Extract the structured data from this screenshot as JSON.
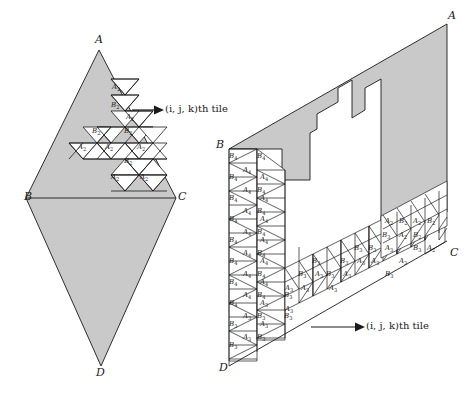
{
  "figure": {
    "colors": {
      "shaded_fill": "#c9c9c9",
      "tile_fill": "#ffffff",
      "stroke": "#1a1a1a",
      "background": "#ffffff"
    }
  },
  "left_diagram": {
    "name": "rhombus-tiling",
    "corners": [
      {
        "id": "A",
        "label": "A",
        "x": 99,
        "y": 42
      },
      {
        "id": "B",
        "label": "B",
        "x": 31,
        "y": 198
      },
      {
        "id": "C",
        "label": "C",
        "x": 174,
        "y": 198
      },
      {
        "id": "D",
        "label": "D",
        "x": 101,
        "y": 372
      }
    ],
    "annotation": {
      "text_prefix": "(",
      "text": "(i, j, k)th tile",
      "arrow_from_x": 132,
      "arrow_to_x": 156,
      "y": 110
    },
    "tiles": [
      {
        "label": "A",
        "sub": "2",
        "x": 117,
        "y": 87
      },
      {
        "label": "B",
        "sub": "2",
        "x": 116,
        "y": 105
      },
      {
        "label": "A",
        "sub": "2",
        "x": 131,
        "y": 117
      },
      {
        "label": "B",
        "sub": "2",
        "x": 97,
        "y": 131
      },
      {
        "label": "B",
        "sub": "2",
        "x": 129,
        "y": 131
      },
      {
        "label": "A",
        "sub": "2",
        "x": 83,
        "y": 147
      },
      {
        "label": "A",
        "sub": "2",
        "x": 110,
        "y": 147
      },
      {
        "label": "A",
        "sub": "2",
        "x": 142,
        "y": 147
      },
      {
        "label": "B",
        "sub": "2",
        "x": 129,
        "y": 161
      },
      {
        "label": "A",
        "sub": "2",
        "x": 116,
        "y": 177
      },
      {
        "label": "A",
        "sub": "2",
        "x": 145,
        "y": 177
      }
    ]
  },
  "right_diagram": {
    "name": "deformed-polygon-tiling",
    "corners": [
      {
        "id": "A",
        "label": "A",
        "x": 450,
        "y": 16
      },
      {
        "id": "B",
        "label": "B",
        "x": 223,
        "y": 145
      },
      {
        "id": "C",
        "label": "C",
        "x": 455,
        "y": 253
      },
      {
        "id": "D",
        "label": "D",
        "x": 226,
        "y": 368
      }
    ],
    "annotation": {
      "text": "(i, j, k)th tile",
      "arrow_from_x": 333,
      "arrow_to_x": 357,
      "y": 327
    },
    "tile_families": [
      "A₂",
      "B₂",
      "A₃",
      "B₃",
      "A₄",
      "B₄"
    ],
    "tiles": [
      {
        "label": "B",
        "sub": "4",
        "x": 234,
        "y": 156
      },
      {
        "label": "B",
        "sub": "4",
        "x": 262,
        "y": 156
      },
      {
        "label": "A",
        "sub": "4",
        "x": 248,
        "y": 170
      },
      {
        "label": "B",
        "sub": "4",
        "x": 234,
        "y": 177
      },
      {
        "label": "A",
        "sub": "4",
        "x": 265,
        "y": 177
      },
      {
        "label": "A",
        "sub": "4",
        "x": 248,
        "y": 190
      },
      {
        "label": "B",
        "sub": "4",
        "x": 262,
        "y": 190
      },
      {
        "label": "B",
        "sub": "4",
        "x": 234,
        "y": 198
      },
      {
        "label": "A",
        "sub": "4",
        "x": 265,
        "y": 198
      },
      {
        "label": "A",
        "sub": "4",
        "x": 248,
        "y": 211
      },
      {
        "label": "B",
        "sub": "4",
        "x": 262,
        "y": 211
      },
      {
        "label": "B",
        "sub": "4",
        "x": 234,
        "y": 219
      },
      {
        "label": "A",
        "sub": "4",
        "x": 265,
        "y": 219
      },
      {
        "label": "A",
        "sub": "4",
        "x": 248,
        "y": 232
      },
      {
        "label": "B",
        "sub": "4",
        "x": 262,
        "y": 232
      },
      {
        "label": "B",
        "sub": "4",
        "x": 234,
        "y": 240
      },
      {
        "label": "A",
        "sub": "4",
        "x": 265,
        "y": 240
      },
      {
        "label": "A",
        "sub": "4",
        "x": 248,
        "y": 253
      },
      {
        "label": "B",
        "sub": "4",
        "x": 262,
        "y": 253
      },
      {
        "label": "B",
        "sub": "4",
        "x": 234,
        "y": 261
      },
      {
        "label": "A",
        "sub": "4",
        "x": 265,
        "y": 261
      },
      {
        "label": "A",
        "sub": "4",
        "x": 248,
        "y": 274
      },
      {
        "label": "B",
        "sub": "4",
        "x": 262,
        "y": 274
      },
      {
        "label": "B",
        "sub": "4",
        "x": 234,
        "y": 282
      },
      {
        "label": "A",
        "sub": "4",
        "x": 265,
        "y": 282
      },
      {
        "label": "A",
        "sub": "4",
        "x": 248,
        "y": 295
      },
      {
        "label": "B",
        "sub": "4",
        "x": 262,
        "y": 295
      },
      {
        "label": "B",
        "sub": "4",
        "x": 234,
        "y": 303
      },
      {
        "label": "A",
        "sub": "3",
        "x": 265,
        "y": 303
      },
      {
        "label": "A",
        "sub": "3",
        "x": 248,
        "y": 316
      },
      {
        "label": "B",
        "sub": "3",
        "x": 262,
        "y": 316
      },
      {
        "label": "B",
        "sub": "3",
        "x": 234,
        "y": 324
      },
      {
        "label": "A",
        "sub": "3",
        "x": 265,
        "y": 324
      },
      {
        "label": "A",
        "sub": "3",
        "x": 248,
        "y": 337
      },
      {
        "label": "B",
        "sub": "3",
        "x": 262,
        "y": 337
      },
      {
        "label": "B",
        "sub": "3",
        "x": 234,
        "y": 345
      },
      {
        "label": "A",
        "sub": "3",
        "x": 290,
        "y": 288
      },
      {
        "label": "B",
        "sub": "3",
        "x": 289,
        "y": 295
      },
      {
        "label": "A",
        "sub": "3",
        "x": 290,
        "y": 309
      },
      {
        "label": "B",
        "sub": "3",
        "x": 289,
        "y": 316
      },
      {
        "label": "B",
        "sub": "3",
        "x": 303,
        "y": 274
      },
      {
        "label": "A",
        "sub": "3",
        "x": 306,
        "y": 288
      },
      {
        "label": "B",
        "sub": "3",
        "x": 317,
        "y": 261
      },
      {
        "label": "A",
        "sub": "3",
        "x": 320,
        "y": 274
      },
      {
        "label": "B",
        "sub": "3",
        "x": 331,
        "y": 274
      },
      {
        "label": "A",
        "sub": "3",
        "x": 334,
        "y": 288
      },
      {
        "label": "B",
        "sub": "3",
        "x": 345,
        "y": 261
      },
      {
        "label": "A",
        "sub": "3",
        "x": 348,
        "y": 274
      },
      {
        "label": "B",
        "sub": "3",
        "x": 359,
        "y": 248
      },
      {
        "label": "A",
        "sub": "3",
        "x": 362,
        "y": 261
      },
      {
        "label": "B",
        "sub": "3",
        "x": 373,
        "y": 248
      },
      {
        "label": "A",
        "sub": "3",
        "x": 376,
        "y": 261
      },
      {
        "label": "B",
        "sub": "3",
        "x": 387,
        "y": 235
      },
      {
        "label": "A",
        "sub": "3",
        "x": 390,
        "y": 248
      },
      {
        "label": "A",
        "sub": "2",
        "x": 390,
        "y": 221
      },
      {
        "label": "B",
        "sub": "2",
        "x": 404,
        "y": 221
      },
      {
        "label": "A",
        "sub": "2",
        "x": 404,
        "y": 235
      },
      {
        "label": "B",
        "sub": "2",
        "x": 418,
        "y": 235
      },
      {
        "label": "A",
        "sub": "2",
        "x": 418,
        "y": 221
      },
      {
        "label": "B",
        "sub": "2",
        "x": 432,
        "y": 221
      },
      {
        "label": "A",
        "sub": "2",
        "x": 432,
        "y": 248
      },
      {
        "label": "B",
        "sub": "3",
        "x": 418,
        "y": 248
      },
      {
        "label": "A",
        "sub": "3",
        "x": 404,
        "y": 261
      },
      {
        "label": "B",
        "sub": "3",
        "x": 390,
        "y": 274
      }
    ]
  }
}
